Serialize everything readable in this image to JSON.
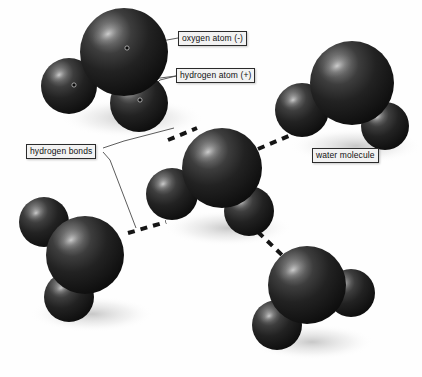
{
  "diagram": {
    "background_color": "#fefefe",
    "sphere_color": "#1c1c1c",
    "highlight_color": "#8f8f8f",
    "bond_color": "#151515",
    "leader_color": "#4a4a4a",
    "label_bg": "#f2f2f2",
    "label_border": "#2b2b2b",
    "label_text_color": "#111111"
  },
  "labels": {
    "oxygen_atom": "oxygen atom (-)",
    "hydrogen_atom": "hydrogen atom (+)",
    "hydrogen_bonds": "hydrogen bonds",
    "water_molecule": "water molecule"
  },
  "molecules": [
    {
      "id": "molecule-top-left",
      "oxygen": {
        "cx": 124,
        "cy": 52,
        "r": 44
      },
      "hydrogens": [
        {
          "cx": 69,
          "cy": 86,
          "r": 28
        },
        {
          "cx": 139,
          "cy": 103,
          "r": 29
        }
      ]
    },
    {
      "id": "molecule-right",
      "oxygen": {
        "cx": 352,
        "cy": 83,
        "r": 42
      },
      "hydrogens": [
        {
          "cx": 302,
          "cy": 110,
          "r": 27
        },
        {
          "cx": 385,
          "cy": 126,
          "r": 24
        }
      ]
    },
    {
      "id": "molecule-center",
      "oxygen": {
        "cx": 222,
        "cy": 168,
        "r": 40
      },
      "hydrogens": [
        {
          "cx": 172,
          "cy": 194,
          "r": 26
        },
        {
          "cx": 249,
          "cy": 211,
          "r": 25
        }
      ]
    },
    {
      "id": "molecule-bottom-left",
      "oxygen": {
        "cx": 85,
        "cy": 255,
        "r": 39
      },
      "hydrogens": [
        {
          "cx": 44,
          "cy": 222,
          "r": 25
        },
        {
          "cx": 69,
          "cy": 297,
          "r": 25
        }
      ]
    },
    {
      "id": "molecule-bottom-right",
      "oxygen": {
        "cx": 307,
        "cy": 285,
        "r": 39
      },
      "hydrogens": [
        {
          "cx": 351,
          "cy": 293,
          "r": 24
        },
        {
          "cx": 277,
          "cy": 325,
          "r": 25
        }
      ]
    }
  ],
  "hydrogen_bonds": [
    {
      "id": "bond-center-to-top-left",
      "x1": 168,
      "y1": 140,
      "x2": 197,
      "y2": 128
    },
    {
      "id": "bond-center-to-right",
      "x1": 258,
      "y1": 149,
      "x2": 310,
      "y2": 127
    },
    {
      "id": "bond-center-to-bottom-left",
      "x1": 128,
      "y1": 233,
      "x2": 166,
      "y2": 222
    },
    {
      "id": "bond-center-to-bottom-right",
      "x1": 258,
      "y1": 232,
      "x2": 283,
      "y2": 256
    }
  ],
  "leader_lines": [
    {
      "id": "leader-oxygen",
      "points": "178,38 167,40 127,48"
    },
    {
      "id": "leader-hydrogen-upper",
      "points": "176,76 160,78 74,85"
    },
    {
      "id": "leader-hydrogen-lower",
      "points": "176,76 160,80 140,100"
    },
    {
      "id": "leader-bonds-upper",
      "points": "103,148 124,141 174,128"
    },
    {
      "id": "leader-bonds-lower",
      "points": "103,152 110,160 136,228"
    }
  ]
}
